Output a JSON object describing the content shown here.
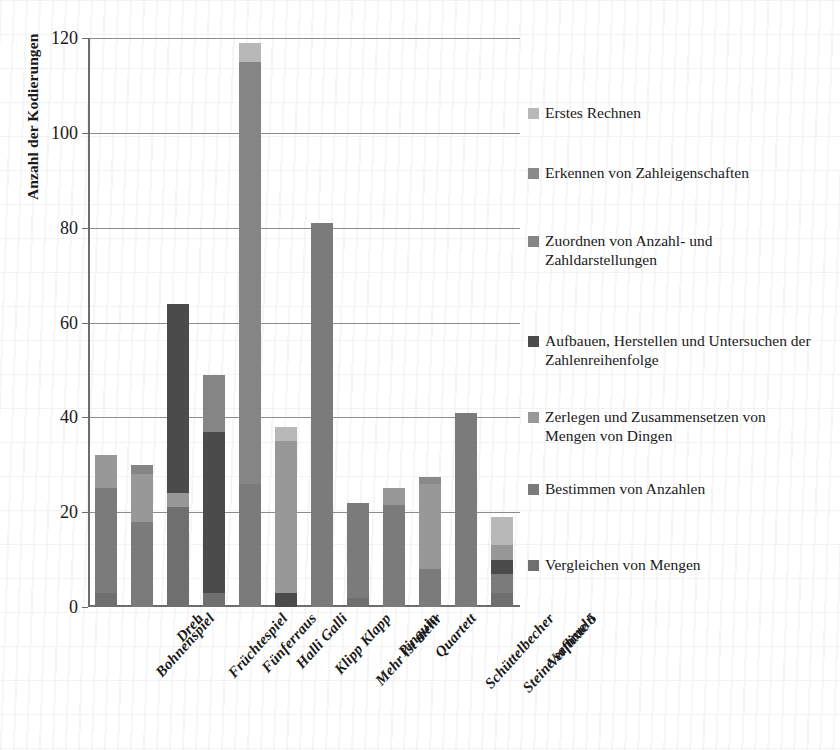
{
  "chart_data": {
    "type": "bar",
    "subtype": "stacked-bar",
    "title": "",
    "xlabel": "",
    "ylabel": "Anzahl der Kodierungen",
    "ylim": [
      0,
      120
    ],
    "ytick_values": [
      0,
      20,
      40,
      60,
      80,
      100,
      120
    ],
    "ytick_labels": [
      "0",
      "20",
      "40",
      "60",
      "80",
      "100",
      "120"
    ],
    "grid": "horizontal",
    "legend_position": "right",
    "categories": [
      "Bohnenspiel",
      "Dreh",
      "Früchtespiel",
      "Fünferraus",
      "Halli Galli",
      "Klipp Klapp",
      "Mehr ist mehr",
      "Pinguin",
      "Quartett",
      "Schüttelbecher",
      "Steine sammeln",
      "Verflixte 5"
    ],
    "series": [
      {
        "name": "Vergleichen von Mengen",
        "color": "#6f6f6f",
        "values": [
          3,
          0,
          21,
          3,
          0,
          0,
          0,
          2,
          0,
          0,
          0,
          3
        ]
      },
      {
        "name": "Bestimmen von Anzahlen",
        "color": "#7b7b7b",
        "values": [
          22,
          18,
          0,
          0,
          26,
          0,
          81,
          20,
          21.5,
          8,
          41,
          4
        ]
      },
      {
        "name": "Zerlegen und Zusammensetzen von Mengen von Dingen",
        "color": "#989898",
        "values": [
          7,
          10,
          3,
          0,
          0,
          32,
          0,
          0,
          3.5,
          18,
          0,
          3
        ]
      },
      {
        "name": "Aufbauen, Herstellen und Untersuchen der Zahlenreihenfolge",
        "color": "#4b4b4b",
        "values": [
          0,
          0,
          40,
          34,
          0,
          3,
          0,
          0,
          0,
          0,
          0,
          3
        ]
      },
      {
        "name": "Zuordnen von Anzahl- und Zahldarstellungen",
        "color": "#858585",
        "values": [
          0,
          2,
          0,
          12,
          89,
          0,
          0,
          0,
          0,
          0,
          0,
          0
        ]
      },
      {
        "name": "Erkennen von Zahleigenschaften",
        "color": "#8a8a8a",
        "values": [
          0,
          0,
          0,
          0,
          0,
          0,
          0,
          0,
          0,
          1.5,
          0,
          0
        ]
      },
      {
        "name": "Erstes Rechnen",
        "color": "#b8b8b8",
        "values": [
          0,
          0,
          0,
          0,
          4,
          3,
          0,
          0,
          0,
          0,
          0,
          6
        ]
      }
    ],
    "totals": [
      32,
      30,
      64,
      49,
      119,
      38,
      81,
      22,
      25,
      27.5,
      41,
      19
    ]
  },
  "y_axis": {
    "title": "Anzahl der Kodierungen",
    "ticks": [
      {
        "value": 120,
        "label": "120"
      },
      {
        "value": 100,
        "label": "100"
      },
      {
        "value": 80,
        "label": "80"
      },
      {
        "value": 60,
        "label": "60"
      },
      {
        "value": 40,
        "label": "40"
      },
      {
        "value": 20,
        "label": "20"
      },
      {
        "value": 0,
        "label": "0"
      }
    ]
  },
  "x_axis": {
    "labels": [
      "Bohnenspiel",
      "Dreh",
      "Früchtespiel",
      "Fünferraus",
      "Halli Galli",
      "Klipp Klapp",
      "Mehr ist mehr",
      "Pinguin",
      "Quartett",
      "Schüttelbecher",
      "Steine sammeln",
      "Verflixte 5"
    ]
  },
  "legend": {
    "items": [
      {
        "label": "Erstes Rechnen",
        "color": "#b8b8b8",
        "top": 0
      },
      {
        "label": "Erkennen von Zahleigenschaften",
        "color": "#8a8a8a",
        "top": 60
      },
      {
        "label": "Zuordnen von Anzahl- und Zahldarstellungen",
        "color": "#858585",
        "top": 128
      },
      {
        "label": "Aufbauen, Herstellen und Untersuchen der Zahlenreihenfolge",
        "color": "#4b4b4b",
        "top": 228
      },
      {
        "label": "Zerlegen und Zusammensetzen von Mengen von Dingen",
        "color": "#989898",
        "top": 304
      },
      {
        "label": "Bestimmen von Anzahlen",
        "color": "#7b7b7b",
        "top": 376
      },
      {
        "label": "Vergleichen von Mengen",
        "color": "#6f6f6f",
        "top": 452
      }
    ]
  },
  "bar_stacks": [
    {
      "category": "Bohnenspiel",
      "segments": [
        {
          "s": 0,
          "e": 3,
          "c": "#6f6f6f"
        },
        {
          "s": 3,
          "e": 25,
          "c": "#7b7b7b"
        },
        {
          "s": 25,
          "e": 32,
          "c": "#989898"
        }
      ]
    },
    {
      "category": "Dreh",
      "segments": [
        {
          "s": 0,
          "e": 18,
          "c": "#7b7b7b"
        },
        {
          "s": 18,
          "e": 28,
          "c": "#989898"
        },
        {
          "s": 28,
          "e": 30,
          "c": "#858585"
        }
      ]
    },
    {
      "category": "Früchtespiel",
      "segments": [
        {
          "s": 0,
          "e": 21,
          "c": "#6f6f6f"
        },
        {
          "s": 21,
          "e": 24,
          "c": "#989898"
        },
        {
          "s": 24,
          "e": 64,
          "c": "#4b4b4b"
        }
      ]
    },
    {
      "category": "Fünferraus",
      "segments": [
        {
          "s": 0,
          "e": 3,
          "c": "#6f6f6f"
        },
        {
          "s": 3,
          "e": 37,
          "c": "#4b4b4b"
        },
        {
          "s": 37,
          "e": 49,
          "c": "#858585"
        }
      ]
    },
    {
      "category": "Halli Galli",
      "segments": [
        {
          "s": 0,
          "e": 26,
          "c": "#7b7b7b"
        },
        {
          "s": 26,
          "e": 115,
          "c": "#858585"
        },
        {
          "s": 115,
          "e": 119,
          "c": "#b8b8b8"
        }
      ]
    },
    {
      "category": "Klipp Klapp",
      "segments": [
        {
          "s": 0,
          "e": 3,
          "c": "#4b4b4b"
        },
        {
          "s": 3,
          "e": 35,
          "c": "#989898"
        },
        {
          "s": 35,
          "e": 38,
          "c": "#b8b8b8"
        }
      ]
    },
    {
      "category": "Mehr ist mehr",
      "segments": [
        {
          "s": 0,
          "e": 81,
          "c": "#7b7b7b"
        }
      ]
    },
    {
      "category": "Pinguin",
      "segments": [
        {
          "s": 0,
          "e": 2,
          "c": "#6f6f6f"
        },
        {
          "s": 2,
          "e": 22,
          "c": "#7b7b7b"
        }
      ]
    },
    {
      "category": "Quartett",
      "segments": [
        {
          "s": 0,
          "e": 21.5,
          "c": "#7b7b7b"
        },
        {
          "s": 21.5,
          "e": 25,
          "c": "#989898"
        }
      ]
    },
    {
      "category": "Schüttelbecher",
      "segments": [
        {
          "s": 0,
          "e": 8,
          "c": "#7b7b7b"
        },
        {
          "s": 8,
          "e": 26,
          "c": "#989898"
        },
        {
          "s": 26,
          "e": 27.5,
          "c": "#8a8a8a"
        }
      ]
    },
    {
      "category": "Steine sammeln",
      "segments": [
        {
          "s": 0,
          "e": 41,
          "c": "#7b7b7b"
        }
      ]
    },
    {
      "category": "Verflixte 5",
      "segments": [
        {
          "s": 0,
          "e": 3,
          "c": "#6f6f6f"
        },
        {
          "s": 3,
          "e": 7,
          "c": "#7b7b7b"
        },
        {
          "s": 7,
          "e": 10,
          "c": "#4b4b4b"
        },
        {
          "s": 10,
          "e": 13,
          "c": "#989898"
        },
        {
          "s": 13,
          "e": 19,
          "c": "#b8b8b8"
        }
      ]
    }
  ]
}
